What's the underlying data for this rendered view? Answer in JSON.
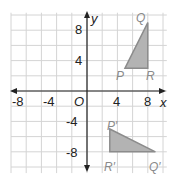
{
  "diagram": {
    "type": "coordinate-plane",
    "axes": {
      "x_label": "x",
      "y_label": "y",
      "origin_label": "O",
      "x_ticks": [
        "-8",
        "-4",
        "4",
        "8"
      ],
      "y_ticks": [
        "8",
        "4",
        "-4",
        "-8"
      ],
      "range": [
        -10,
        10
      ]
    },
    "colors": {
      "grid": "#d4d4d4",
      "axis": "#222222",
      "fill": "#b3b3b3",
      "stroke": "#8c8c8c",
      "label": "#8a8a8a"
    },
    "triangles": [
      {
        "name": "PQR",
        "vertices": [
          {
            "label": "P",
            "x": 5,
            "y": 3
          },
          {
            "label": "Q",
            "x": 8,
            "y": 9
          },
          {
            "label": "R",
            "x": 8,
            "y": 3
          }
        ]
      },
      {
        "name": "P'Q'R'",
        "vertices": [
          {
            "label": "P′",
            "x": 3,
            "y": -5
          },
          {
            "label": "Q′",
            "x": 9,
            "y": -8
          },
          {
            "label": "R′",
            "x": 3,
            "y": -8
          }
        ]
      }
    ]
  }
}
